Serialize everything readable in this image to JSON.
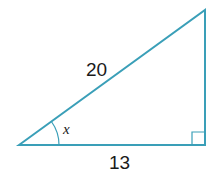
{
  "diagram": {
    "type": "right-triangle",
    "stroke_color": "#3a9fb8",
    "labels": {
      "hypotenuse": "20",
      "adjacent": "13",
      "angle": "x"
    },
    "right_angle_marker": "bottom-right"
  }
}
